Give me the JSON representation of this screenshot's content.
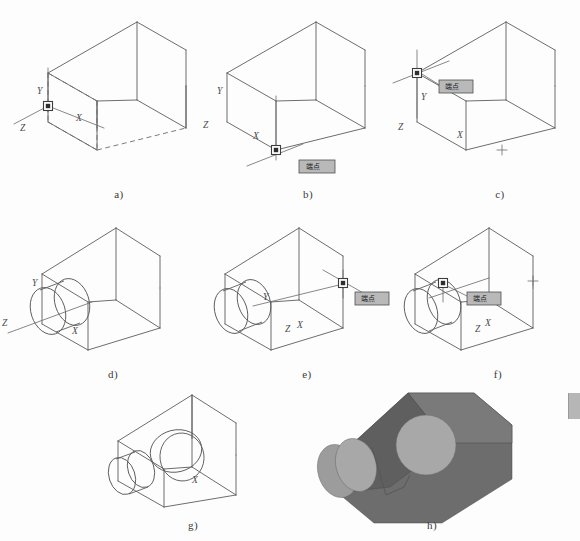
{
  "figure": {
    "background_color": "#fdfdfd",
    "line_color": "#5c5c5c",
    "tooltip_fill": "#b9b9b9",
    "shade_color": "#6d6d6d"
  },
  "axis_labels": {
    "x": "X",
    "y": "Y",
    "z": "Z"
  },
  "tooltips": {
    "endpoint": "端点",
    "insert": "端点"
  },
  "panels": [
    {
      "id": "a",
      "caption": "a)",
      "description": "Wireframe wedge block with hidden edges shown dashed; UCS at lower-left front corner",
      "ucs_origin": "lower-left-front-corner",
      "has_hidden_edges": true,
      "has_cylinder": false,
      "cylinder_count": 0,
      "tooltip": null,
      "axis_labels_shown": [
        "Y",
        "X",
        "Z"
      ]
    },
    {
      "id": "b",
      "caption": "b)",
      "description": "Block with UCS being moved to bottom front vertex, endpoint snap marker active",
      "ucs_origin": "bottom-front-vertex",
      "has_hidden_edges": false,
      "has_cylinder": false,
      "cylinder_count": 0,
      "tooltip": "端点",
      "axis_labels_shown": [
        "Y",
        "X",
        "Z"
      ]
    },
    {
      "id": "c",
      "caption": "c)",
      "description": "UCS relocated to upper-left corner of left face with endpoint snap tooltip",
      "ucs_origin": "upper-left-corner",
      "has_hidden_edges": false,
      "has_cylinder": false,
      "cylinder_count": 0,
      "tooltip": "端点",
      "axis_labels_shown": [
        "Y",
        "X",
        "Z"
      ]
    },
    {
      "id": "d",
      "caption": "d)",
      "description": "Cylinder created on the left vertical face, UCS at cylinder centre",
      "ucs_origin": "left-face-cylinder-centre",
      "has_hidden_edges": false,
      "has_cylinder": true,
      "cylinder_count": 1,
      "tooltip": null,
      "axis_labels_shown": [
        "Y",
        "X",
        "Z"
      ]
    },
    {
      "id": "e",
      "caption": "e)",
      "description": "UCS moved to right-hand rear edge vertex, endpoint snap tooltip visible",
      "ucs_origin": "right-rear-vertex",
      "has_hidden_edges": false,
      "has_cylinder": true,
      "cylinder_count": 1,
      "tooltip": "端点",
      "axis_labels_shown": [
        "Y",
        "Z",
        "X"
      ]
    },
    {
      "id": "f",
      "caption": "f)",
      "description": "UCS snapped to interior corner point on sloped face, endpoint tooltip shown",
      "ucs_origin": "sloped-face-corner",
      "has_hidden_edges": false,
      "has_cylinder": true,
      "cylinder_count": 1,
      "tooltip": "端点",
      "axis_labels_shown": [
        "Z",
        "X"
      ]
    },
    {
      "id": "g",
      "caption": "g)",
      "description": "Completed wireframe with two cylinders: one on left face, one on sloped face",
      "ucs_origin": null,
      "has_hidden_edges": false,
      "has_cylinder": true,
      "cylinder_count": 2,
      "tooltip": null,
      "axis_labels_shown": [
        "X"
      ]
    },
    {
      "id": "h",
      "caption": "h)",
      "description": "Shaded solid render of the finished model showing both bosses",
      "ucs_origin": null,
      "has_hidden_edges": false,
      "has_cylinder": true,
      "cylinder_count": 2,
      "tooltip": null,
      "axis_labels_shown": []
    }
  ]
}
